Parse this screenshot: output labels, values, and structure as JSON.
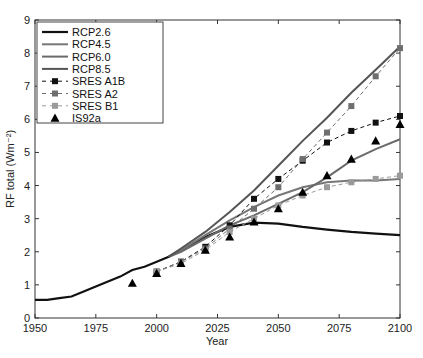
{
  "chart_data": {
    "type": "line",
    "title": "",
    "xlabel": "Year",
    "ylabel": "RF total (Wm⁻²)",
    "xlim": [
      1950,
      2100
    ],
    "ylim": [
      0,
      9
    ],
    "xticks": [
      1950,
      1975,
      2000,
      2025,
      2050,
      2075,
      2100
    ],
    "yticks": [
      0,
      1,
      2,
      3,
      4,
      5,
      6,
      7,
      8,
      9
    ],
    "grid": false,
    "legend_position": "upper left",
    "historical": {
      "x": [
        1950,
        1955,
        1960,
        1965,
        1970,
        1975,
        1980,
        1985,
        1990,
        1995,
        2000,
        2005
      ],
      "y": [
        0.55,
        0.55,
        0.6,
        0.65,
        0.8,
        0.95,
        1.1,
        1.25,
        1.45,
        1.55,
        1.7,
        1.85
      ]
    },
    "series": [
      {
        "name": "RCP2.6",
        "style": "line",
        "color": "#111111",
        "width": 2.2,
        "x": [
          2005,
          2010,
          2020,
          2030,
          2040,
          2050,
          2060,
          2070,
          2080,
          2090,
          2100
        ],
        "y": [
          1.85,
          2.05,
          2.45,
          2.75,
          2.88,
          2.85,
          2.75,
          2.67,
          2.6,
          2.55,
          2.5
        ]
      },
      {
        "name": "RCP4.5",
        "style": "line",
        "color": "#777777",
        "width": 2.0,
        "x": [
          2005,
          2010,
          2020,
          2030,
          2040,
          2050,
          2060,
          2070,
          2080,
          2090,
          2100
        ],
        "y": [
          1.85,
          2.05,
          2.5,
          2.95,
          3.35,
          3.7,
          3.95,
          4.1,
          4.15,
          4.15,
          4.2
        ]
      },
      {
        "name": "RCP6.0",
        "style": "line",
        "color": "#6a6a6a",
        "width": 2.0,
        "x": [
          2005,
          2010,
          2020,
          2030,
          2040,
          2050,
          2060,
          2070,
          2080,
          2090,
          2100
        ],
        "y": [
          1.85,
          2.0,
          2.4,
          2.8,
          3.1,
          3.45,
          3.8,
          4.25,
          4.75,
          5.1,
          5.4
        ]
      },
      {
        "name": "RCP8.5",
        "style": "line",
        "color": "#555555",
        "width": 2.0,
        "x": [
          2005,
          2010,
          2020,
          2030,
          2040,
          2050,
          2060,
          2070,
          2080,
          2090,
          2100
        ],
        "y": [
          1.85,
          2.1,
          2.6,
          3.2,
          3.85,
          4.6,
          5.35,
          6.05,
          6.8,
          7.5,
          8.2
        ]
      },
      {
        "name": "SRES A1B",
        "style": "dashed-square",
        "color": "#111111",
        "x": [
          2000,
          2010,
          2020,
          2030,
          2040,
          2050,
          2060,
          2070,
          2080,
          2090,
          2100
        ],
        "y": [
          1.4,
          1.7,
          2.15,
          2.8,
          3.6,
          4.2,
          4.75,
          5.3,
          5.65,
          5.9,
          6.1
        ]
      },
      {
        "name": "SRES A2",
        "style": "dashed-square",
        "color": "#6e6e6e",
        "x": [
          2000,
          2010,
          2020,
          2030,
          2040,
          2050,
          2060,
          2070,
          2080,
          2090,
          2100
        ],
        "y": [
          1.4,
          1.7,
          2.1,
          2.7,
          3.3,
          3.95,
          4.8,
          5.6,
          6.4,
          7.3,
          8.15
        ]
      },
      {
        "name": "SRES B1",
        "style": "dashed-square",
        "color": "#9a9a9a",
        "x": [
          2000,
          2010,
          2020,
          2030,
          2040,
          2050,
          2060,
          2070,
          2080,
          2090,
          2100
        ],
        "y": [
          1.4,
          1.65,
          2.05,
          2.6,
          3.0,
          3.4,
          3.7,
          3.95,
          4.1,
          4.2,
          4.3
        ]
      },
      {
        "name": "IS92a",
        "style": "triangle",
        "color": "#000000",
        "x": [
          1990,
          2000,
          2010,
          2020,
          2030,
          2040,
          2050,
          2060,
          2070,
          2080,
          2090,
          2100
        ],
        "y": [
          1.05,
          1.35,
          1.65,
          2.05,
          2.45,
          2.9,
          3.3,
          3.8,
          4.3,
          4.8,
          5.35,
          5.85
        ]
      }
    ]
  }
}
